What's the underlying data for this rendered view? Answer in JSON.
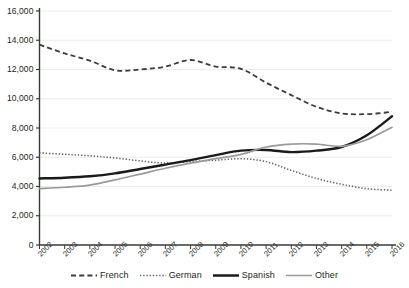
{
  "chart_data": {
    "type": "line",
    "title": "",
    "xlabel": "",
    "ylabel": "",
    "x": [
      "2002",
      "2003",
      "2004",
      "2005",
      "2006",
      "2007",
      "2008",
      "2009",
      "2010",
      "2011",
      "2012",
      "2013",
      "2014",
      "2015",
      "2016"
    ],
    "ylim": [
      0,
      16000
    ],
    "yticks": [
      0,
      2000,
      4000,
      6000,
      8000,
      10000,
      12000,
      14000,
      16000
    ],
    "ytick_labels": [
      "0",
      "2,000",
      "4,000",
      "6,000",
      "8,000",
      "10,000",
      "12,000",
      "14,000",
      "16,000"
    ],
    "grid": true,
    "legend_position": "bottom",
    "series": [
      {
        "name": "French",
        "style": "dashed",
        "color": "#3c3c3c",
        "values": [
          13700,
          13100,
          12600,
          11950,
          12000,
          12200,
          12650,
          12200,
          12050,
          11100,
          10250,
          9450,
          9000,
          8950,
          9100
        ]
      },
      {
        "name": "German",
        "style": "dotted",
        "color": "#5a5a5a",
        "values": [
          6300,
          6200,
          6100,
          5950,
          5750,
          5600,
          5700,
          5800,
          5900,
          5700,
          5100,
          4550,
          4150,
          3850,
          3750
        ]
      },
      {
        "name": "Spanish",
        "style": "solid-thick",
        "color": "#1a1a1a",
        "values": [
          4550,
          4600,
          4700,
          4900,
          5200,
          5500,
          5800,
          6150,
          6450,
          6500,
          6350,
          6450,
          6700,
          7500,
          8800
        ]
      },
      {
        "name": "Other",
        "style": "solid-thin",
        "color": "#9a9a9a",
        "values": [
          3850,
          3950,
          4100,
          4450,
          4850,
          5250,
          5600,
          5900,
          6200,
          6700,
          6900,
          6900,
          6750,
          7200,
          8050
        ]
      }
    ]
  },
  "legend": {
    "items": [
      {
        "label": "French"
      },
      {
        "label": "German"
      },
      {
        "label": "Spanish"
      },
      {
        "label": "Other"
      }
    ]
  }
}
